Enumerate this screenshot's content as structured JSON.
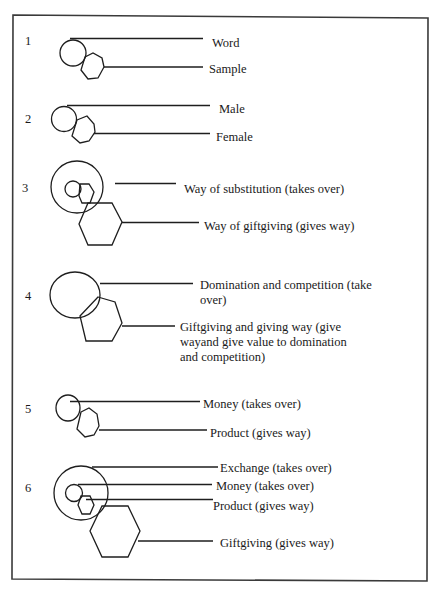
{
  "diagram": {
    "legend_shapes": {
      "circle": "takes-over element",
      "hexagon": "gives-way element"
    },
    "sections": [
      {
        "number": "1",
        "labels": [
          "Word",
          "Sample"
        ]
      },
      {
        "number": "2",
        "labels": [
          "Male",
          "Female"
        ]
      },
      {
        "number": "3",
        "labels": [
          "Way of substitution (takes over)",
          "Way of giftgiving (gives way)"
        ]
      },
      {
        "number": "4",
        "labels": [
          [
            "Domination and competition (take",
            "over)"
          ],
          [
            "Giftgiving and giving way (give",
            "wayand give value to domination",
            "and competition)"
          ]
        ]
      },
      {
        "number": "5",
        "labels": [
          "Money (takes over)",
          "Product (gives way)"
        ]
      },
      {
        "number": "6",
        "labels": [
          "Exchange (takes over)",
          "Money (takes over)",
          "Product (gives way)",
          "Giftgiving (gives way)"
        ]
      }
    ]
  },
  "colors": {
    "background": "#ffffff",
    "stroke": "#1e1e1e",
    "frame": "#3a3a3a",
    "text": "#1a1a1a"
  }
}
